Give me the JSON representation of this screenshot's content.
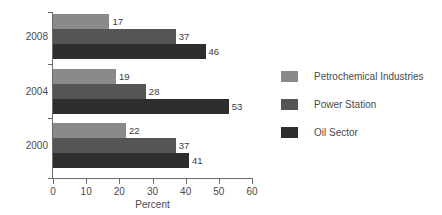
{
  "chart_data": {
    "type": "bar",
    "orientation": "horizontal",
    "title": "",
    "xlabel": "Percent",
    "ylabel": "",
    "xlim": [
      0,
      60
    ],
    "xticks": [
      0,
      10,
      20,
      30,
      40,
      50,
      60
    ],
    "xtick_labels": [
      "0",
      "10",
      "20",
      "30",
      "40",
      "50",
      "60"
    ],
    "categories": [
      "2008",
      "2004",
      "2000"
    ],
    "grid": false,
    "legend_position": "right",
    "series": [
      {
        "name": "Petrochemical Industries",
        "color": "#8a8a8a",
        "values": [
          17,
          19,
          22
        ]
      },
      {
        "name": "Power Station",
        "color": "#555555",
        "values": [
          37,
          28,
          37
        ]
      },
      {
        "name": "Oil Sector",
        "color": "#2e2e2e",
        "values": [
          46,
          53,
          41
        ]
      }
    ],
    "data_labels": [
      [
        "17",
        "37",
        "46"
      ],
      [
        "19",
        "28",
        "53"
      ],
      [
        "22",
        "37",
        "41"
      ]
    ]
  },
  "axis": {
    "x_title": "Percent",
    "ticks": [
      "0",
      "10",
      "20",
      "30",
      "40",
      "50",
      "60"
    ],
    "group_labels": [
      "2008",
      "2004",
      "2000"
    ]
  },
  "legend": {
    "items": [
      {
        "label": "Petrochemical Industries",
        "color": "#8a8a8a"
      },
      {
        "label": "Power Station",
        "color": "#555555"
      },
      {
        "label": "Oil Sector",
        "color": "#2e2e2e"
      }
    ]
  },
  "colors": {
    "axis": "#6b6b6b",
    "text": "#4a4a4a",
    "background": "#ffffff"
  }
}
